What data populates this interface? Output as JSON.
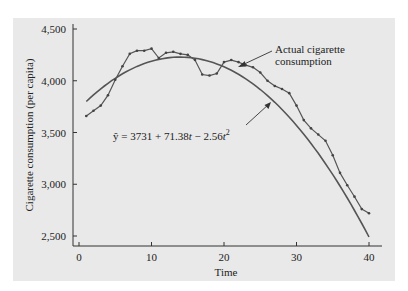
{
  "chart_data": {
    "type": "line",
    "title": "",
    "xlabel": "Time",
    "ylabel": "Cigarette consumption (per capita)",
    "xlim": [
      0,
      41
    ],
    "ylim": [
      2450,
      4520
    ],
    "x_ticks": [
      0,
      10,
      20,
      30,
      40
    ],
    "x_tick_labels": [
      "0",
      "10",
      "20",
      "30",
      "40"
    ],
    "y_ticks": [
      2500,
      3000,
      3500,
      4000,
      4500
    ],
    "y_tick_labels": [
      "2,500",
      "3,000",
      "3,500",
      "4,000",
      "4,500"
    ],
    "grid": false,
    "legend": null,
    "series": [
      {
        "name": "Actual cigarette consumption",
        "style": "line with markers",
        "x": [
          1,
          2,
          3,
          4,
          5,
          6,
          7,
          8,
          9,
          10,
          11,
          12,
          13,
          14,
          15,
          16,
          17,
          18,
          19,
          20,
          21,
          22,
          23,
          24,
          25,
          26,
          27,
          28,
          29,
          30,
          31,
          32,
          33,
          34,
          35,
          36,
          37,
          38,
          39,
          40
        ],
        "values": [
          3660,
          3710,
          3760,
          3860,
          4010,
          4140,
          4260,
          4290,
          4290,
          4310,
          4220,
          4270,
          4280,
          4260,
          4250,
          4200,
          4060,
          4050,
          4070,
          4180,
          4200,
          4180,
          4150,
          4130,
          4080,
          4000,
          3950,
          3920,
          3880,
          3760,
          3620,
          3540,
          3480,
          3420,
          3280,
          3110,
          2990,
          2880,
          2760,
          2720
        ]
      },
      {
        "name": "Fitted quadratic trend",
        "style": "smooth line",
        "equation": "ŷ = 3731 + 71.38t − 2.56t²",
        "x_range": [
          1,
          40
        ]
      }
    ],
    "annotations": [
      {
        "text": "Actual cigarette consumption",
        "points_to": "Actual cigarette consumption"
      },
      {
        "text": "ŷ = 3731 + 71.38t − 2.56t²",
        "points_to": "Fitted quadratic trend"
      }
    ]
  },
  "labels": {
    "ylabel": "Cigarette consumption (per capita)",
    "xlabel": "Time",
    "annotation_actual_line1": "Actual cigarette",
    "annotation_actual_line2": "consumption",
    "equation_prefix": "ŷ = 3731 + 71.38",
    "equation_t1": "t",
    "equation_mid": " − 2.56",
    "equation_t2": "t",
    "equation_exp": "2"
  },
  "colors": {
    "panel_background": "#e9e9e9",
    "line": "#4a4a4a",
    "axis": "#333333",
    "text": "#222222"
  }
}
